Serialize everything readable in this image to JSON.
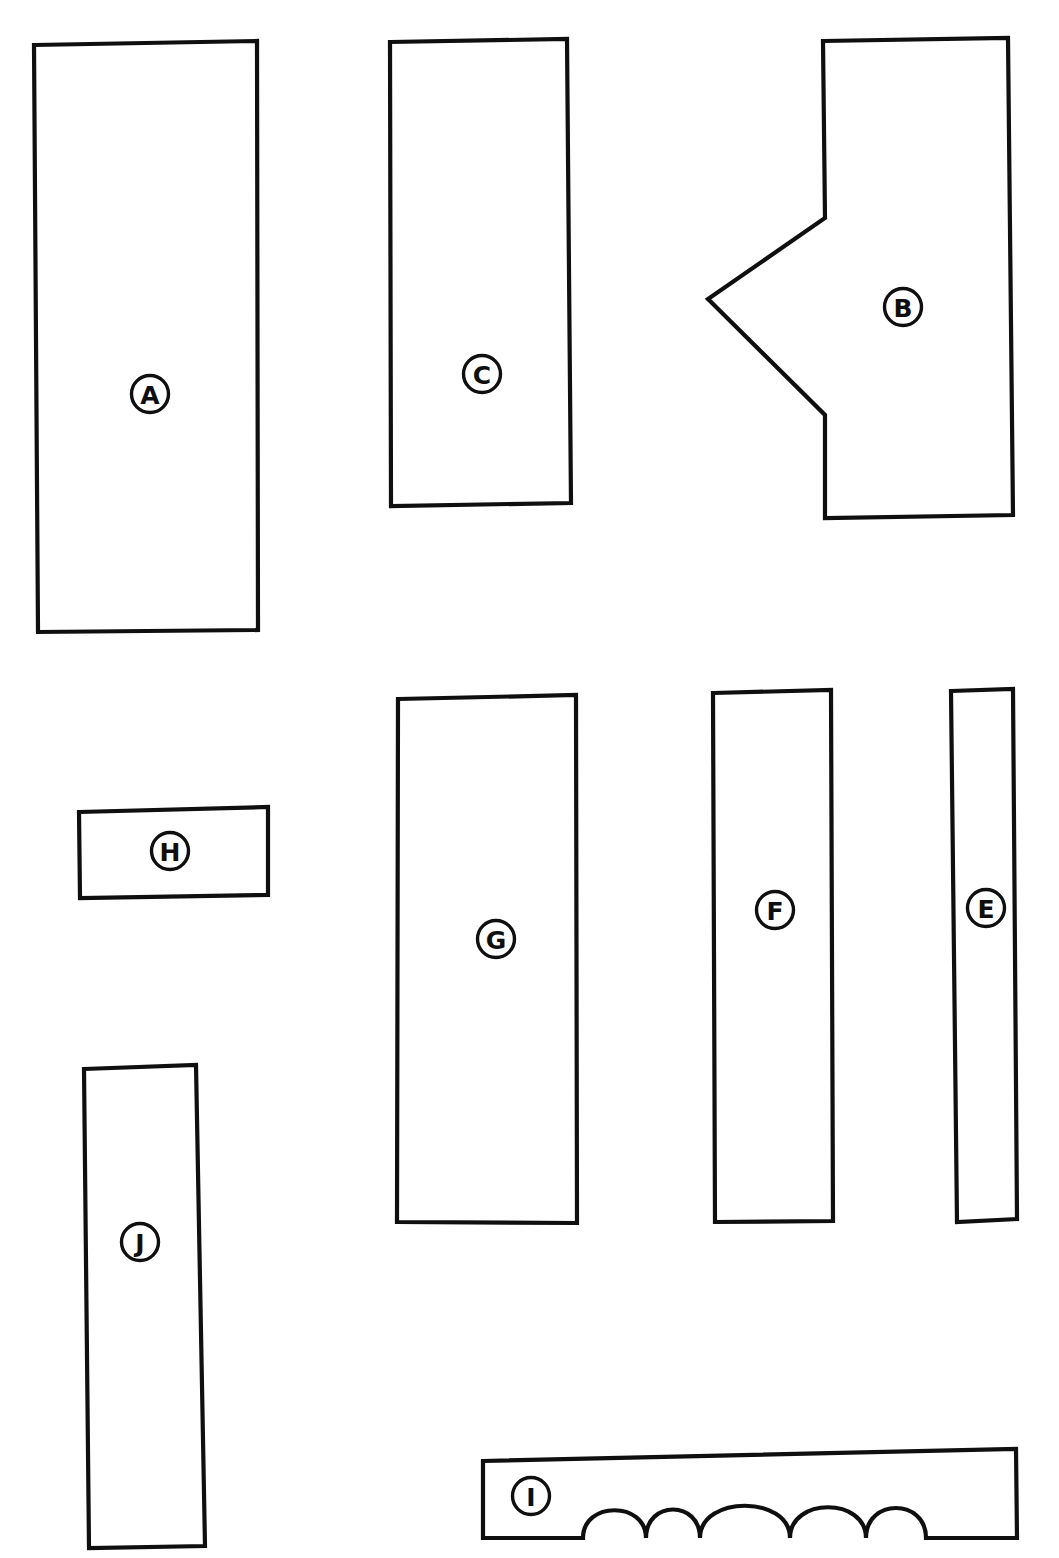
{
  "sheet": {
    "width": 1059,
    "height": 1558,
    "background_color": "#ffffff",
    "ink_color": "#0f0f0f",
    "title": "Hand-drawn parts layout sheet",
    "stroke_width": 4.2,
    "tag_stroke_width": 3.4,
    "tag_radius": 18.5,
    "tag_font_size": 25
  },
  "parts": [
    {
      "id": "part-a",
      "label": "A",
      "outline_kind": "quadrilateral",
      "points": "34,45 257,41 258,630 38,632",
      "tag": {
        "cx": 150,
        "cy": 394
      }
    },
    {
      "id": "part-c",
      "label": "C",
      "outline_kind": "quadrilateral",
      "points": "390,42 567,39 571,503 391,506",
      "tag": {
        "cx": 482,
        "cy": 374
      }
    },
    {
      "id": "part-b",
      "label": "B",
      "outline_kind": "notched-hexagon",
      "points": "823,41 1008,38 1013,515 825,518 825,415 708,299 825,218",
      "tag": {
        "cx": 903,
        "cy": 307
      }
    },
    {
      "id": "part-h",
      "label": "H",
      "outline_kind": "quadrilateral",
      "points": "79,812 268,807 268,895 80,898",
      "tag": {
        "cx": 170,
        "cy": 851
      }
    },
    {
      "id": "part-g",
      "label": "G",
      "outline_kind": "quadrilateral",
      "points": "398,699 576,695 577,1223 397,1222",
      "tag": {
        "cx": 496,
        "cy": 939
      }
    },
    {
      "id": "part-f",
      "label": "F",
      "outline_kind": "quadrilateral",
      "points": "713,693 831,690 833,1221 715,1222",
      "tag": {
        "cx": 775,
        "cy": 910
      }
    },
    {
      "id": "part-e",
      "label": "E",
      "outline_kind": "quadrilateral",
      "points": "951,691 1013,689 1017,1219 957,1222",
      "tag": {
        "cx": 986,
        "cy": 908
      }
    },
    {
      "id": "part-j",
      "label": "J",
      "outline_kind": "quadrilateral",
      "points": "84,1069 196,1065 205,1546 89,1548",
      "tag": {
        "cx": 140,
        "cy": 1242
      }
    },
    {
      "id": "part-i",
      "label": "I",
      "outline_kind": "scalloped-bar",
      "path": "M 483,1461 L 1016,1449 L 1017,1538 L 926,1538 C 926,1498 866,1498 866,1538 C 866,1497 790,1497 790,1538 C 790,1495 700,1495 700,1538 C 700,1500 646,1500 646,1538 C 646,1501 583,1501 583,1538 L 483,1538 Z",
      "tag": {
        "cx": 531,
        "cy": 1496
      }
    }
  ],
  "part_labels": [
    "A",
    "B",
    "C",
    "E",
    "F",
    "G",
    "H",
    "I",
    "J"
  ]
}
